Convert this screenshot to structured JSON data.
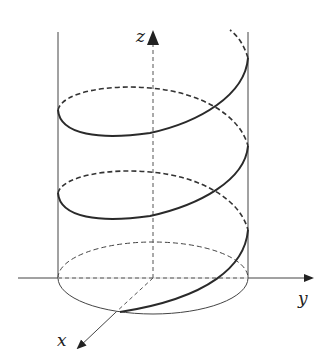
{
  "diagram": {
    "axes": {
      "x_label": "x",
      "y_label": "y",
      "z_label": "z"
    },
    "colors": {
      "stroke": "#333333",
      "helix": "#2a2a2a",
      "background": "#ffffff"
    },
    "elements": [
      "cylinder",
      "base-ellipse",
      "helix-curve",
      "x-axis",
      "y-axis",
      "z-axis"
    ]
  }
}
